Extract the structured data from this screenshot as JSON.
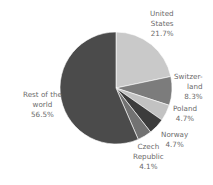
{
  "chart_data": {
    "type": "pie",
    "title": "",
    "start_angle_deg": 0,
    "direction": "clockwise",
    "slices": [
      {
        "name": "United States",
        "label_lines": [
          "United",
          "States",
          "21.7%"
        ],
        "value": 21.7,
        "color": "#c9c9c9"
      },
      {
        "name": "Switzerland",
        "label_lines": [
          "Switzer-",
          "land",
          "8.3%"
        ],
        "value": 8.3,
        "color": "#7c7c7c"
      },
      {
        "name": "Poland",
        "label_lines": [
          "Poland",
          "4.7%"
        ],
        "value": 4.7,
        "color": "#c2c2c2"
      },
      {
        "name": "Norway",
        "label_lines": [
          "Norway",
          "4.7%"
        ],
        "value": 4.7,
        "color": "#3c3c3c"
      },
      {
        "name": "Czech Republic",
        "label_lines": [
          "Czech",
          "Republic",
          "4.1%"
        ],
        "value": 4.1,
        "color": "#727272"
      },
      {
        "name": "Rest of the world",
        "label_lines": [
          "Rest of the",
          "world",
          "56.5%"
        ],
        "value": 56.5,
        "color": "#4b4b4b"
      }
    ],
    "legend": "none (direct labels)"
  },
  "labels": {
    "us": {
      "l1": "United",
      "l2": "States",
      "l3": "21.7%"
    },
    "ch": {
      "l1": "Switzer-",
      "l2": "land",
      "l3": "8.3%"
    },
    "pl": {
      "l1": "Poland",
      "l2": "4.7%"
    },
    "no": {
      "l1": "Norway",
      "l2": "4.7%"
    },
    "cz": {
      "l1": "Czech",
      "l2": "Republic",
      "l3": "4.1%"
    },
    "rw": {
      "l1": "Rest of the",
      "l2": "world",
      "l3": "56.5%"
    }
  }
}
